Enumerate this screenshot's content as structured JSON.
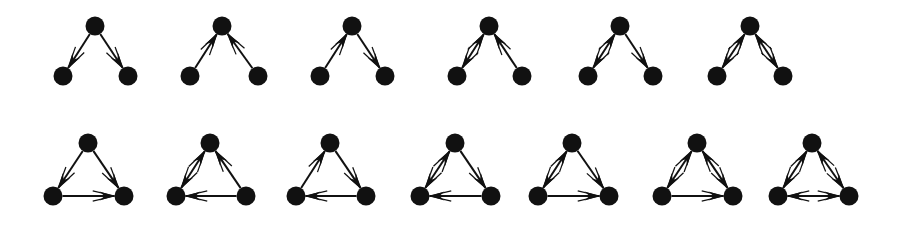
{
  "figure": {
    "background_color": "#ffffff",
    "node_color": "#111111",
    "edge_color": "#111111",
    "node_radius": 9.5,
    "edge_width": 2.0,
    "arrow_length": 15,
    "arrow_half_width": 4.5,
    "width": 908,
    "height": 227
  },
  "rows": [
    {
      "name": "row-top-open-triads",
      "apex_y": 26,
      "base_y": 76,
      "triads": [
        {
          "label": "triad-1",
          "apex_x": 95,
          "left_x": 63,
          "right_x": 128,
          "edges": [
            {
              "from": "apex",
              "to": "left",
              "direction": "forward"
            },
            {
              "from": "apex",
              "to": "right",
              "direction": "forward"
            }
          ]
        },
        {
          "label": "triad-2",
          "apex_x": 222,
          "left_x": 190,
          "right_x": 258,
          "edges": [
            {
              "from": "apex",
              "to": "left",
              "direction": "reverse"
            },
            {
              "from": "apex",
              "to": "right",
              "direction": "reverse"
            }
          ]
        },
        {
          "label": "triad-3",
          "apex_x": 352,
          "left_x": 320,
          "right_x": 385,
          "edges": [
            {
              "from": "apex",
              "to": "left",
              "direction": "reverse"
            },
            {
              "from": "apex",
              "to": "right",
              "direction": "forward"
            }
          ]
        },
        {
          "label": "triad-4",
          "apex_x": 489,
          "left_x": 457,
          "right_x": 522,
          "edges": [
            {
              "from": "apex",
              "to": "left",
              "direction": "both"
            },
            {
              "from": "apex",
              "to": "right",
              "direction": "reverse"
            }
          ]
        },
        {
          "label": "triad-5",
          "apex_x": 620,
          "left_x": 588,
          "right_x": 653,
          "edges": [
            {
              "from": "apex",
              "to": "left",
              "direction": "both"
            },
            {
              "from": "apex",
              "to": "right",
              "direction": "forward"
            }
          ]
        },
        {
          "label": "triad-6",
          "apex_x": 750,
          "left_x": 717,
          "right_x": 783,
          "edges": [
            {
              "from": "apex",
              "to": "left",
              "direction": "both"
            },
            {
              "from": "apex",
              "to": "right",
              "direction": "both"
            }
          ]
        }
      ]
    },
    {
      "name": "row-bottom-closed-triads",
      "apex_y": 143,
      "base_y": 196,
      "triads": [
        {
          "label": "triad-7",
          "apex_x": 88,
          "left_x": 53,
          "right_x": 124,
          "edges": [
            {
              "from": "apex",
              "to": "left",
              "direction": "forward"
            },
            {
              "from": "apex",
              "to": "right",
              "direction": "forward"
            },
            {
              "from": "left",
              "to": "right",
              "direction": "forward"
            }
          ]
        },
        {
          "label": "triad-8",
          "apex_x": 210,
          "left_x": 176,
          "right_x": 246,
          "edges": [
            {
              "from": "apex",
              "to": "left",
              "direction": "both"
            },
            {
              "from": "apex",
              "to": "right",
              "direction": "reverse"
            },
            {
              "from": "left",
              "to": "right",
              "direction": "reverse"
            }
          ]
        },
        {
          "label": "triad-9",
          "apex_x": 330,
          "left_x": 296,
          "right_x": 366,
          "edges": [
            {
              "from": "apex",
              "to": "left",
              "direction": "reverse"
            },
            {
              "from": "apex",
              "to": "right",
              "direction": "forward"
            },
            {
              "from": "left",
              "to": "right",
              "direction": "reverse"
            }
          ]
        },
        {
          "label": "triad-10",
          "apex_x": 455,
          "left_x": 420,
          "right_x": 491,
          "edges": [
            {
              "from": "apex",
              "to": "left",
              "direction": "both"
            },
            {
              "from": "apex",
              "to": "right",
              "direction": "forward"
            },
            {
              "from": "left",
              "to": "right",
              "direction": "reverse"
            }
          ]
        },
        {
          "label": "triad-11",
          "apex_x": 572,
          "left_x": 538,
          "right_x": 609,
          "edges": [
            {
              "from": "apex",
              "to": "left",
              "direction": "both"
            },
            {
              "from": "apex",
              "to": "right",
              "direction": "forward"
            },
            {
              "from": "left",
              "to": "right",
              "direction": "forward"
            }
          ]
        },
        {
          "label": "triad-12",
          "apex_x": 697,
          "left_x": 662,
          "right_x": 733,
          "edges": [
            {
              "from": "apex",
              "to": "left",
              "direction": "both"
            },
            {
              "from": "apex",
              "to": "right",
              "direction": "both"
            },
            {
              "from": "left",
              "to": "right",
              "direction": "forward"
            }
          ]
        },
        {
          "label": "triad-13",
          "apex_x": 812,
          "left_x": 778,
          "right_x": 849,
          "edges": [
            {
              "from": "apex",
              "to": "left",
              "direction": "both"
            },
            {
              "from": "apex",
              "to": "right",
              "direction": "both"
            },
            {
              "from": "left",
              "to": "right",
              "direction": "both"
            }
          ]
        }
      ]
    }
  ]
}
